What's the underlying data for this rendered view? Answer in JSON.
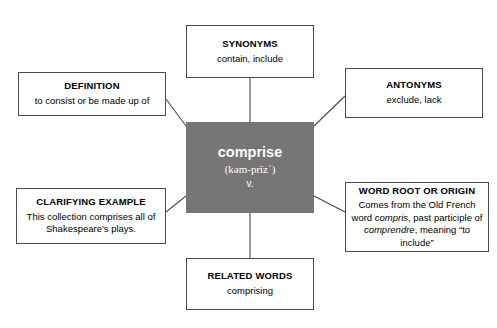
{
  "diagram": {
    "type": "word-study-concept-map",
    "center": {
      "headword": "comprise",
      "pronunciation": "(kəm-prīz´)",
      "part_of_speech": "v.",
      "background_color": "#767676",
      "text_color": "#ffffff"
    },
    "nodes": [
      {
        "id": "synonyms",
        "title": "SYNONYMS",
        "body": "contain, include"
      },
      {
        "id": "definition",
        "title": "DEFINITION",
        "body": "to consist or be made up of"
      },
      {
        "id": "antonyms",
        "title": "ANTONYMS",
        "body": "exclude, lack"
      },
      {
        "id": "clarifying-example",
        "title": "CLARIFYING EXAMPLE",
        "body": "This collection comprises all of Shakespeare's plays."
      },
      {
        "id": "word-root-or-origin",
        "title": "WORD ROOT OR ORIGIN",
        "body_prefix": "Comes from the Old French word ",
        "body_italic_1": "compris",
        "body_middle": ", past participle of ",
        "body_italic_2": "comprendre",
        "body_suffix": ", meaning “to include”"
      },
      {
        "id": "related-words",
        "title": "RELATED WORDS",
        "body": "comprising"
      }
    ],
    "connector_color": "#4a4a4a",
    "border_color": "#4a4a4a"
  }
}
